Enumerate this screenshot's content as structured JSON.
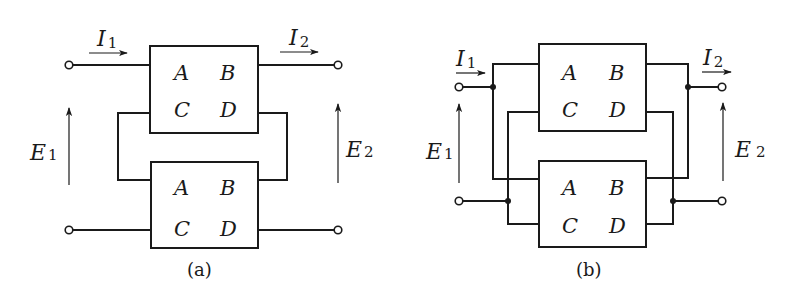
{
  "figure": {
    "type": "two-port network interconnections",
    "panels": [
      {
        "id": "a",
        "caption": "(a)",
        "connection": "series-series",
        "current_in": {
          "symbol": "I",
          "sub": "1"
        },
        "current_out": {
          "symbol": "I",
          "sub": "2"
        },
        "voltage_in": {
          "symbol": "E",
          "sub": "1"
        },
        "voltage_out": {
          "symbol": "E",
          "sub": "2"
        },
        "top_box": {
          "a": "A",
          "b": "B",
          "c": "C",
          "d": "D"
        },
        "bottom_box": {
          "a": "A",
          "b": "B",
          "c": "C",
          "d": "D"
        }
      },
      {
        "id": "b",
        "caption": "(b)",
        "connection": "parallel-parallel",
        "current_in": {
          "symbol": "I",
          "sub": "1"
        },
        "current_out": {
          "symbol": "I",
          "sub": "2"
        },
        "voltage_in": {
          "symbol": "E",
          "sub": "1"
        },
        "voltage_out": {
          "symbol": "E",
          "sub": "2"
        },
        "top_box": {
          "a": "A",
          "b": "B",
          "c": "C",
          "d": "D"
        },
        "bottom_box": {
          "a": "A",
          "b": "B",
          "c": "C",
          "d": "D"
        }
      }
    ]
  },
  "colors": {
    "line": "#1a1a1a",
    "background": "#ffffff"
  }
}
